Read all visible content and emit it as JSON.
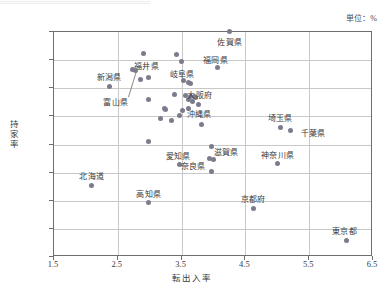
{
  "unit_note": "単位：%",
  "chart_data": {
    "type": "scatter",
    "title": "",
    "xlabel": "転出入率",
    "ylabel": "持家率",
    "xlim": [
      1.5,
      6.5
    ],
    "ylim": [
      45.0,
      85.0
    ],
    "xticks": [
      "1.5",
      "2.5",
      "3.5",
      "4.5",
      "5.5",
      "6.5"
    ],
    "xtick_values": [
      1.5,
      2.5,
      3.5,
      4.5,
      5.5,
      6.5
    ],
    "yticks": [
      "45.0",
      "50.0",
      "55.0",
      "60.0",
      "65.0",
      "70.0",
      "75.0",
      "80.0",
      "85.0"
    ],
    "ytick_values": [
      45.0,
      50.0,
      55.0,
      60.0,
      65.0,
      70.0,
      75.0,
      80.0,
      85.0
    ],
    "grid": true,
    "legend": false,
    "unit": "%",
    "points": [
      {
        "label": "佐賀県",
        "x": 4.27,
        "y": 84.9,
        "label_dx": 0,
        "label_dy": 11,
        "anchor": "middle"
      },
      {
        "label": "福岡県",
        "x": 4.08,
        "y": 78.5,
        "label_dx": -2,
        "label_dy": -7,
        "anchor": "middle"
      },
      {
        "label": "福井県",
        "x": 2.92,
        "y": 81.0,
        "label_dx": 3,
        "label_dy": 13,
        "anchor": "middle"
      },
      {
        "label": "岐阜県",
        "x": 3.43,
        "y": 80.8,
        "label_dx": 6,
        "label_dy": 20,
        "anchor": "middle"
      },
      {
        "label": "新潟県",
        "x": 2.38,
        "y": 75.2,
        "label_dx": 0,
        "label_dy": -8,
        "anchor": "middle"
      },
      {
        "label": "富山県",
        "x": 2.8,
        "y": 77.9,
        "label_dx": -20,
        "label_dy": 32,
        "anchor": "middle",
        "leader": true
      },
      {
        "label": "大阪府",
        "x": 3.66,
        "y": 73.3,
        "label_dx": 9,
        "label_dy": -1,
        "anchor": "middle"
      },
      {
        "label": "沖縄県",
        "x": 3.62,
        "y": 71.2,
        "label_dx": 11,
        "label_dy": 6,
        "anchor": "middle"
      },
      {
        "label": "埼玉県",
        "x": 5.06,
        "y": 67.9,
        "label_dx": 0,
        "label_dy": -8,
        "anchor": "middle"
      },
      {
        "label": "千葉県",
        "x": 5.23,
        "y": 67.3,
        "label_dx": 22,
        "label_dy": 3,
        "anchor": "middle"
      },
      {
        "label": "神奈川県",
        "x": 5.02,
        "y": 61.4,
        "label_dx": 0,
        "label_dy": -8,
        "anchor": "middle"
      },
      {
        "label": "愛知県",
        "x": 3.49,
        "y": 61.2,
        "label_dx": -2,
        "label_dy": -8,
        "anchor": "middle"
      },
      {
        "label": "滋賀県",
        "x": 3.98,
        "y": 64.4,
        "label_dx": 15,
        "label_dy": 6,
        "anchor": "middle"
      },
      {
        "label": "奈良県",
        "x": 3.95,
        "y": 62.3,
        "label_dx": -16,
        "label_dy": 8,
        "anchor": "middle"
      },
      {
        "label": "北海道",
        "x": 2.11,
        "y": 57.6,
        "label_dx": 0,
        "label_dy": -8,
        "anchor": "middle"
      },
      {
        "label": "高知県",
        "x": 3.0,
        "y": 54.5,
        "label_dx": 0,
        "label_dy": -8,
        "anchor": "middle"
      },
      {
        "label": "京都府",
        "x": 4.64,
        "y": 53.5,
        "label_dx": 0,
        "label_dy": -8,
        "anchor": "middle"
      },
      {
        "label": "東京都",
        "x": 6.1,
        "y": 47.8,
        "label_dx": -2,
        "label_dy": -8,
        "anchor": "middle"
      }
    ],
    "unlabeled_points": [
      {
        "x": 2.75,
        "y": 78.1
      },
      {
        "x": 2.87,
        "y": 76.4
      },
      {
        "x": 3.0,
        "y": 76.7
      },
      {
        "x": 3.52,
        "y": 79.5
      },
      {
        "x": 3.55,
        "y": 76.2
      },
      {
        "x": 3.62,
        "y": 75.8
      },
      {
        "x": 3.66,
        "y": 75.6
      },
      {
        "x": 3.0,
        "y": 72.9
      },
      {
        "x": 3.4,
        "y": 73.8
      },
      {
        "x": 3.58,
        "y": 73.6
      },
      {
        "x": 3.62,
        "y": 72.9
      },
      {
        "x": 3.68,
        "y": 72.5
      },
      {
        "x": 3.72,
        "y": 73.4
      },
      {
        "x": 3.74,
        "y": 73.1
      },
      {
        "x": 3.78,
        "y": 71.9
      },
      {
        "x": 3.24,
        "y": 71.3
      },
      {
        "x": 3.26,
        "y": 71.0
      },
      {
        "x": 3.18,
        "y": 69.5
      },
      {
        "x": 3.36,
        "y": 69.1
      },
      {
        "x": 3.49,
        "y": 70.0
      },
      {
        "x": 3.53,
        "y": 70.8
      },
      {
        "x": 3.83,
        "y": 68.4
      },
      {
        "x": 3.0,
        "y": 65.3
      },
      {
        "x": 4.02,
        "y": 62.2
      },
      {
        "x": 3.98,
        "y": 60.0
      }
    ]
  }
}
